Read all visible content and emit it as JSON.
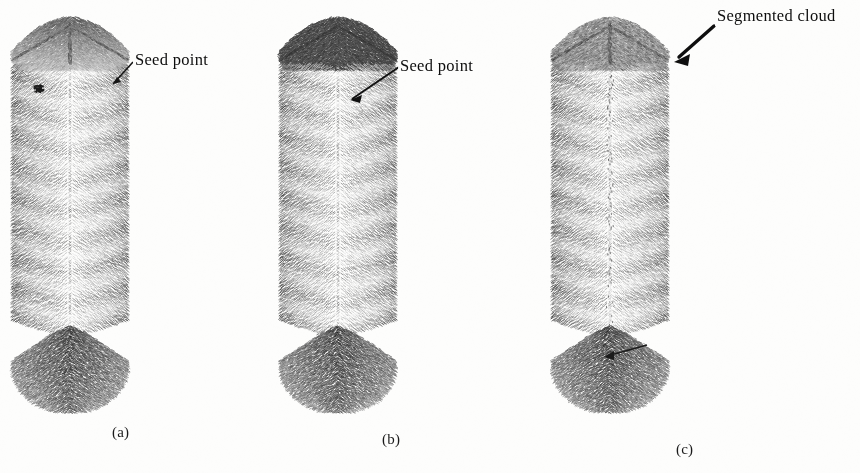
{
  "figure": {
    "kind": "scanned-scientific-figure",
    "background_color": "#fdfdfc",
    "ink_color": "#2b2b2b",
    "width": 860,
    "height": 473,
    "panels": [
      {
        "id": "a",
        "label": "(a)",
        "annotation": "Seed point",
        "description": "point cloud cylinder with small dark seed point on upper cap",
        "top_cap_shading": "partially-dark",
        "has_seed_marker": true,
        "has_seam": false
      },
      {
        "id": "b",
        "label": "(b)",
        "annotation": "Seed point",
        "description": "point cloud cylinder with fully dark grown region on upper cap",
        "top_cap_shading": "solid-dark",
        "has_seed_marker": false,
        "has_seam": false
      },
      {
        "id": "c",
        "label": "(c)",
        "annotation": "Segmented cloud",
        "description": "point cloud cylinder with textured segmented cloud cap and vertical seam",
        "top_cap_shading": "textured",
        "has_seed_marker": false,
        "has_seam": true
      }
    ]
  },
  "chart_data": {
    "type": "scatter",
    "title": "",
    "subtitle": "",
    "xlabel": "",
    "ylabel": "",
    "legend_position": "none",
    "grid": false,
    "annotations": [
      {
        "text": "Seed point",
        "panel": "a",
        "x": 133,
        "y": 50,
        "arrow_to_x": 108,
        "arrow_to_y": 88
      },
      {
        "text": "Seed point",
        "panel": "b",
        "x": 398,
        "y": 56,
        "arrow_to_x": 352,
        "arrow_to_y": 98
      },
      {
        "text": "Segmented cloud",
        "panel": "c",
        "x": 715,
        "y": 6,
        "arrow_to_x": 674,
        "arrow_to_y": 60
      }
    ],
    "series": [
      {
        "name": "cylinder-a-points",
        "panel": "a",
        "point_count": 5200,
        "shade": "mixed"
      },
      {
        "name": "cylinder-b-points",
        "panel": "b",
        "point_count": 5200,
        "shade": "mixed"
      },
      {
        "name": "cylinder-c-points",
        "panel": "c",
        "point_count": 5200,
        "shade": "mixed"
      }
    ],
    "geometry": {
      "projection": "isometric",
      "shape": "cylinder",
      "cylinder_center_x": [
        70,
        338,
        610
      ],
      "cylinder_top_y": 18,
      "cylinder_bottom_y": 412,
      "cylinder_radius_x": 58,
      "cylinder_radius_y": 26
    }
  }
}
